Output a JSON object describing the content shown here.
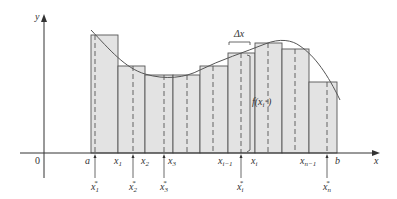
{
  "diagram": {
    "colors": {
      "axis": "#333333",
      "rect_fill": "#e3e3e3",
      "rect_stroke": "#555555",
      "curve": "#555555",
      "dash": "#555555"
    },
    "axes": {
      "x_label": "x",
      "y_label": "y",
      "origin_label": "0"
    },
    "delta_label": "Δx",
    "height_label": "f(x",
    "height_label_sub": "i",
    "height_label_sup": "*",
    "height_label_close": ")",
    "partition_labels": [
      {
        "main": "a",
        "sub": ""
      },
      {
        "main": "x",
        "sub": "1"
      },
      {
        "main": "x",
        "sub": "2"
      },
      {
        "main": "x",
        "sub": "3"
      },
      {
        "main": "x",
        "sub": "i−1"
      },
      {
        "main": "x",
        "sub": "i"
      },
      {
        "main": "x",
        "sub": "n−1"
      },
      {
        "main": "b",
        "sub": ""
      }
    ],
    "sample_labels": [
      {
        "main": "x",
        "sub": "1",
        "sup": "*"
      },
      {
        "main": "x",
        "sub": "2",
        "sup": "*"
      },
      {
        "main": "x",
        "sub": "3",
        "sup": "*"
      },
      {
        "main": "x",
        "sub": "i",
        "sup": "*"
      },
      {
        "main": "x",
        "sub": "n",
        "sup": "*"
      }
    ],
    "rectangles": [
      {
        "x0": 91,
        "x1": 118,
        "top": 35,
        "sample_x": 95
      },
      {
        "x0": 118,
        "x1": 145,
        "top": 66,
        "sample_x": 133
      },
      {
        "x0": 145,
        "x1": 173,
        "top": 75,
        "sample_x": 164
      },
      {
        "x0": 173,
        "x1": 200,
        "top": 75,
        "sample_x": 187
      },
      {
        "x0": 200,
        "x1": 228,
        "top": 66,
        "sample_x": 213
      },
      {
        "x0": 228,
        "x1": 255,
        "top": 53,
        "sample_x": 241
      },
      {
        "x0": 255,
        "x1": 282,
        "top": 43,
        "sample_x": 268
      },
      {
        "x0": 282,
        "x1": 309,
        "top": 49,
        "sample_x": 295
      },
      {
        "x0": 309,
        "x1": 337,
        "top": 82,
        "sample_x": 327
      }
    ]
  }
}
